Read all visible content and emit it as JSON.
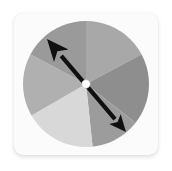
{
  "canvas": {
    "width": 172,
    "height": 171,
    "background_color": "#ffffff"
  },
  "card": {
    "background_color": "#fbfbfb",
    "corner_radius": 9,
    "shadow_color": "#00000022",
    "label": "spinner wheel card"
  },
  "spinner": {
    "title": "Spinner Wheel",
    "center_x": 72,
    "center_y": 71,
    "radius": 63,
    "segment_count": 6,
    "pivot": {
      "label": "pivot dot",
      "color": "#ffffff",
      "radius": 4.2,
      "outline_color": "#bdbdbd"
    },
    "needle": {
      "label": "spinner needle",
      "color": "#101010",
      "points_to_segment": 1,
      "tip_angle_degrees": 132,
      "tip_x": 33,
      "tip_y": 26,
      "tail_x": 112,
      "tail_y": 119
    },
    "segments": [
      {
        "index": 0,
        "name": "segment-top-right",
        "color": "#a8a8a8",
        "start_angle": -90,
        "end_angle": -28,
        "sweep": 62
      },
      {
        "index": 1,
        "name": "segment-right",
        "color": "#8e8e8e",
        "start_angle": -28,
        "end_angle": 38,
        "sweep": 66
      },
      {
        "index": 2,
        "name": "segment-bottom-right",
        "color": "#9c9c9c",
        "start_angle": 38,
        "end_angle": 84,
        "sweep": 46
      },
      {
        "index": 3,
        "name": "segment-bottom",
        "color": "#d8d8d8",
        "start_angle": 84,
        "end_angle": 150,
        "sweep": 66
      },
      {
        "index": 4,
        "name": "segment-left",
        "color": "#b0b0b0",
        "start_angle": 150,
        "end_angle": 208,
        "sweep": 58
      },
      {
        "index": 5,
        "name": "segment-top-left",
        "color": "#9a9a9a",
        "start_angle": 208,
        "end_angle": 270,
        "sweep": 62
      }
    ]
  }
}
